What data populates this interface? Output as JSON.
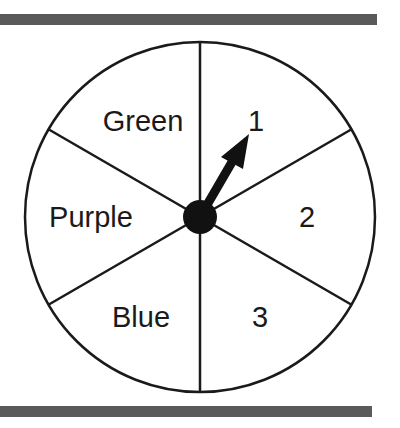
{
  "spinner": {
    "sections": [
      {
        "label": "1",
        "position": "upper-right"
      },
      {
        "label": "2",
        "position": "right"
      },
      {
        "label": "3",
        "position": "lower-right"
      },
      {
        "label": "Blue",
        "position": "lower-left"
      },
      {
        "label": "Purple",
        "position": "left"
      },
      {
        "label": "Green",
        "position": "upper-left"
      }
    ],
    "section_count": 6,
    "arrow_points_to": "1",
    "colors": {
      "line": "#1a1a1a",
      "rule": "#5a5a5a",
      "background": "#ffffff"
    }
  }
}
